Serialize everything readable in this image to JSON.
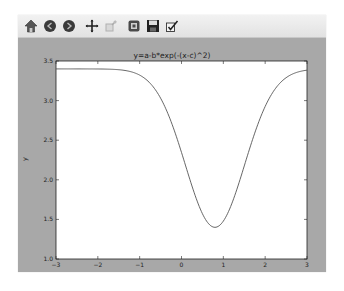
{
  "toolbar": {
    "buttons": [
      {
        "name": "home-icon",
        "label": "Home"
      },
      {
        "name": "back-icon",
        "label": "Back"
      },
      {
        "name": "forward-icon",
        "label": "Forward"
      },
      {
        "name": "pan-icon",
        "label": "Pan"
      },
      {
        "name": "zoom-icon",
        "label": "Zoom",
        "disabled": true
      },
      {
        "name": "configure-subplots-icon",
        "label": "Configure subplots"
      },
      {
        "name": "save-icon",
        "label": "Save"
      },
      {
        "name": "edit-icon",
        "label": "Edit curves"
      }
    ]
  },
  "chart_data": {
    "type": "line",
    "title": "y=a-b*exp(-(x-c)^2)",
    "xlabel": "",
    "ylabel": "y",
    "xlim": [
      -3,
      3
    ],
    "ylim": [
      1.0,
      3.5
    ],
    "xticks": [
      "-3",
      "-2",
      "-1",
      "0",
      "1",
      "2",
      "3"
    ],
    "yticks": [
      "1.0",
      "1.5",
      "2.0",
      "2.5",
      "3.0",
      "3.5"
    ],
    "grid": false,
    "legend": null,
    "series": [
      {
        "name": "y=a-b*exp(-(x-c)^2)",
        "params": {
          "a": 3.4,
          "b": 2.0,
          "c": 0.8
        },
        "x": [
          -3.0,
          -2.5,
          -2.0,
          -1.5,
          -1.0,
          -0.75,
          -0.5,
          -0.25,
          0.0,
          0.25,
          0.5,
          0.75,
          0.8,
          1.0,
          1.25,
          1.5,
          1.75,
          2.0,
          2.5,
          3.0
        ],
        "y": [
          3.4,
          3.4,
          3.4,
          3.39,
          3.32,
          3.22,
          3.03,
          2.74,
          2.35,
          1.92,
          1.58,
          1.4,
          1.4,
          1.48,
          1.76,
          2.17,
          2.59,
          2.93,
          3.29,
          3.38
        ]
      }
    ],
    "colors": {
      "line": "#555555",
      "figure_bg": "#a8a8a8",
      "axes_bg": "#ffffff"
    }
  }
}
